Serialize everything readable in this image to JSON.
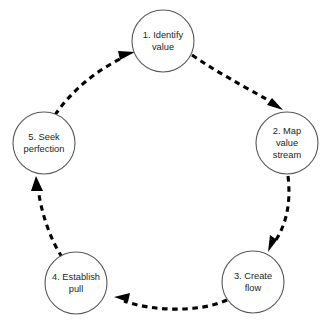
{
  "diagram": {
    "type": "cycle-diagram",
    "direction": "clockwise",
    "background_color": "#ffffff",
    "node_stroke_color": "#58585a",
    "node_fill_color": "#ffffff",
    "arrow_color": "#000000",
    "arrow_style": "dashed",
    "text_color": "#231f20",
    "nodes": [
      {
        "id": "node-1",
        "number": "1.",
        "name": "identify-value",
        "lines": [
          "1. Identify",
          "value"
        ],
        "line1": "1. Identify",
        "line2": "value",
        "line3": "",
        "cx": 163,
        "cy": 41,
        "r": 31
      },
      {
        "id": "node-2",
        "number": "2.",
        "name": "map-value-stream",
        "lines": [
          "2. Map",
          "value",
          "stream"
        ],
        "line1": "2. Map",
        "line2": "value",
        "line3": "stream",
        "cx": 287,
        "cy": 143,
        "r": 31
      },
      {
        "id": "node-3",
        "number": "3.",
        "name": "create-flow",
        "lines": [
          "3. Create",
          "flow"
        ],
        "line1": "3. Create",
        "line2": "flow",
        "line3": "",
        "cx": 253,
        "cy": 282,
        "r": 31
      },
      {
        "id": "node-4",
        "number": "4.",
        "name": "establish-pull",
        "lines": [
          "4. Establish",
          "pull"
        ],
        "line1": "4. Establish",
        "line2": "pull",
        "line3": "",
        "cx": 76,
        "cy": 283,
        "r": 31
      },
      {
        "id": "node-5",
        "number": "5.",
        "name": "seek-perfection",
        "lines": [
          "5. Seek",
          "perfection"
        ],
        "line1": "5. Seek",
        "line2": "perfection",
        "line3": "",
        "cx": 44,
        "cy": 143,
        "r": 31
      }
    ],
    "edges": [
      {
        "id": "edge-1-2",
        "from": "node-1",
        "to": "node-2",
        "label": ""
      },
      {
        "id": "edge-2-3",
        "from": "node-2",
        "to": "node-3",
        "label": ""
      },
      {
        "id": "edge-3-4",
        "from": "node-3",
        "to": "node-4",
        "label": ""
      },
      {
        "id": "edge-4-5",
        "from": "node-4",
        "to": "node-5",
        "label": ""
      },
      {
        "id": "edge-5-1",
        "from": "node-5",
        "to": "node-1",
        "label": ""
      }
    ]
  }
}
